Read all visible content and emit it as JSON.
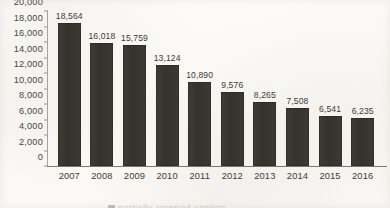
{
  "chart_data": {
    "type": "bar",
    "title": "",
    "xlabel": "",
    "ylabel": "",
    "categories": [
      "2007",
      "2008",
      "2009",
      "2010",
      "2011",
      "2012",
      "2013",
      "2014",
      "2015",
      "2016"
    ],
    "values": [
      18564,
      16018,
      15759,
      13124,
      10890,
      9576,
      8265,
      7508,
      6541,
      6235
    ],
    "value_labels": [
      "18,564",
      "16,018",
      "15,759",
      "13,124",
      "10,890",
      "9,576",
      "8,265",
      "7,508",
      "6,541",
      "6,235"
    ],
    "ylim": [
      0,
      20000
    ],
    "y_tick_step": 2000,
    "y_ticks": [
      20000,
      18000,
      16000,
      14000,
      12000,
      10000,
      8000,
      6000,
      4000,
      2000,
      0
    ],
    "y_tick_labels": [
      "20,000",
      "18,000",
      "16,000",
      "14,000",
      "12,000",
      "10,000",
      "8,000",
      "6,000",
      "4,000",
      "2,000",
      "0"
    ],
    "grid": false,
    "legend": false,
    "data_labels_shown": true,
    "bar_color": "#3a3631",
    "background_color": "#fbfaf7",
    "axis_color": "#7d776e",
    "text_color": "#413c36"
  },
  "caption_remnant": {
    "text": "partially cropped caption"
  }
}
